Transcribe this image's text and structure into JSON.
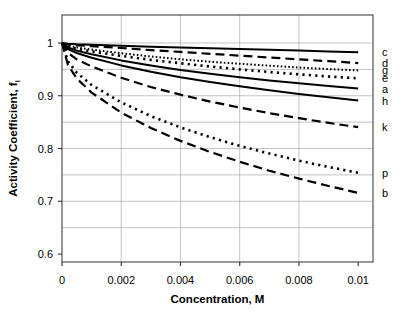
{
  "chart_data": {
    "type": "line",
    "title": "",
    "xlabel": "Concentration, M",
    "ylabel": "Activity  Coefficient,  f",
    "ylabel_subscript": "i",
    "xlim": [
      0,
      0.0105
    ],
    "ylim": [
      0.585,
      1.053
    ],
    "xticks": [
      0,
      0.002,
      0.004,
      0.006,
      0.008,
      0.01
    ],
    "xtick_labels": [
      "0",
      "0.002",
      "0.004",
      "0.006",
      "0.008",
      "0.01"
    ],
    "yticks": [
      0.6,
      0.7,
      0.8,
      0.9,
      1
    ],
    "ytick_labels": [
      "0.6",
      "0.7",
      "0.8",
      "0.9",
      "1"
    ],
    "grid": true,
    "grid_x_values": [
      0.002,
      0.004,
      0.006,
      0.008
    ],
    "grid_y_values": [
      0.65,
      0.7,
      0.75,
      0.8,
      0.85,
      0.9,
      0.95,
      1.0
    ],
    "legend_position": "right-edge-labels",
    "x": [
      0,
      0.0002,
      0.0005,
      0.001,
      0.002,
      0.003,
      0.004,
      0.005,
      0.006,
      0.007,
      0.008,
      0.009,
      0.01
    ],
    "series": [
      {
        "name": "c",
        "label": "c",
        "style": "solid",
        "values": [
          1.0,
          0.9985,
          0.9975,
          0.9965,
          0.9945,
          0.993,
          0.9915,
          0.99,
          0.9885,
          0.987,
          0.9855,
          0.984,
          0.9825
        ]
      },
      {
        "name": "d",
        "label": "d",
        "style": "dashed",
        "values": [
          1.0,
          0.997,
          0.9955,
          0.994,
          0.9905,
          0.9865,
          0.983,
          0.9795,
          0.976,
          0.9725,
          0.969,
          0.9655,
          0.962
        ]
      },
      {
        "name": "g",
        "label": "g",
        "style": "dotted-fine",
        "values": [
          1.0,
          0.995,
          0.9915,
          0.9875,
          0.9805,
          0.9745,
          0.969,
          0.9645,
          0.9605,
          0.957,
          0.9535,
          0.9505,
          0.948
        ]
      },
      {
        "name": "e",
        "label": "e",
        "style": "dotted-coarse",
        "values": [
          1.0,
          0.9935,
          0.989,
          0.984,
          0.9755,
          0.968,
          0.9615,
          0.9555,
          0.95,
          0.945,
          0.9405,
          0.9365,
          0.933
        ]
      },
      {
        "name": "a",
        "label": "a",
        "style": "solid",
        "values": [
          1.0,
          0.9915,
          0.9855,
          0.9785,
          0.967,
          0.9575,
          0.949,
          0.9415,
          0.935,
          0.929,
          0.9235,
          0.9185,
          0.9135
        ]
      },
      {
        "name": "h",
        "label": "h",
        "style": "solid",
        "values": [
          1.0,
          0.9885,
          0.981,
          0.972,
          0.9575,
          0.9455,
          0.935,
          0.926,
          0.918,
          0.9105,
          0.9035,
          0.897,
          0.891
        ]
      },
      {
        "name": "k",
        "label": "k",
        "style": "dashed",
        "values": [
          1.0,
          0.9815,
          0.969,
          0.9555,
          0.934,
          0.9165,
          0.902,
          0.889,
          0.8775,
          0.867,
          0.8575,
          0.8485,
          0.8405
        ]
      },
      {
        "name": "p",
        "label": "p",
        "style": "dotted-coarse",
        "values": [
          1.0,
          0.9655,
          0.9435,
          0.9205,
          0.8875,
          0.8615,
          0.84,
          0.8215,
          0.805,
          0.7905,
          0.777,
          0.765,
          0.754
        ]
      },
      {
        "name": "b",
        "label": "b",
        "style": "dashed",
        "values": [
          1.0,
          0.9585,
          0.9325,
          0.906,
          0.868,
          0.839,
          0.8145,
          0.7935,
          0.775,
          0.758,
          0.743,
          0.729,
          0.716
        ]
      }
    ]
  }
}
